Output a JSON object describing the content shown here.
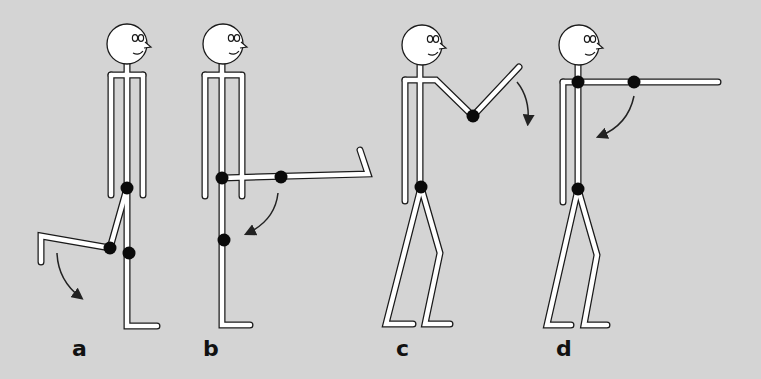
{
  "diagram": {
    "background": "#d4d4d4",
    "limb_fill": "#ffffff",
    "limb_outline": "#1a1a1a",
    "joint_color": "#0a0a0a",
    "figures": [
      {
        "id": "a",
        "label": "a",
        "label_pos": [
          72,
          336
        ],
        "description": "Standing figure flexing hip and knee; lower leg swinging down",
        "head": [
          127,
          44
        ],
        "limbs": [
          [
            [
              127,
              64
            ],
            [
              127,
              326
            ],
            [
              157,
              326
            ]
          ],
          [
            [
              111,
              75
            ],
            [
              143,
              75
            ]
          ],
          [
            [
              111,
              75
            ],
            [
              111,
              195
            ]
          ],
          [
            [
              143,
              75
            ],
            [
              143,
              195
            ]
          ],
          [
            [
              127,
              188
            ],
            [
              110,
              248
            ],
            [
              41,
              236
            ],
            [
              41,
              262
            ]
          ]
        ],
        "joints": [
          [
            127,
            188
          ],
          [
            110,
            248
          ],
          [
            129,
            253
          ]
        ],
        "arrow": {
          "from": [
            57,
            253
          ],
          "ctrl": [
            58,
            280
          ],
          "to": [
            80,
            297
          ]
        }
      },
      {
        "id": "b",
        "label": "b",
        "label_pos": [
          203,
          336
        ],
        "description": "Standing figure with hip flexed 90°, knee extended, foot up",
        "head": [
          223,
          44
        ],
        "limbs": [
          [
            [
              222,
              64
            ],
            [
              222,
              325
            ],
            [
              250,
              325
            ]
          ],
          [
            [
              205,
              75
            ],
            [
              240,
              75
            ]
          ],
          [
            [
              205,
              75
            ],
            [
              205,
              196
            ]
          ],
          [
            [
              242,
              75
            ],
            [
              242,
              196
            ]
          ],
          [
            [
              222,
              178
            ],
            [
              368,
              174
            ],
            [
              360,
              150
            ]
          ]
        ],
        "joints": [
          [
            222,
            178
          ],
          [
            281,
            177
          ],
          [
            224,
            240
          ]
        ],
        "arrow": {
          "from": [
            278,
            193
          ],
          "ctrl": [
            275,
            220
          ],
          "to": [
            248,
            233
          ]
        }
      },
      {
        "id": "c",
        "label": "c",
        "label_pos": [
          396,
          336
        ],
        "description": "Standing figure with elbow flexed, forearm raised; forearm swings down",
        "head": [
          422,
          45
        ],
        "limbs": [
          [
            [
              420,
              65
            ],
            [
              420,
              187
            ]
          ],
          [
            [
              405,
              80
            ],
            [
              436,
              80
            ],
            [
              473,
              116
            ],
            [
              519,
              67
            ]
          ],
          [
            [
              405,
              80
            ],
            [
              405,
              201
            ]
          ],
          [
            [
              421,
              187
            ],
            [
              386,
              324
            ],
            [
              413,
              324
            ]
          ],
          [
            [
              421,
              187
            ],
            [
              440,
              253
            ],
            [
              425,
              324
            ],
            [
              450,
              324
            ]
          ]
        ],
        "joints": [
          [
            473,
            116
          ],
          [
            421,
            187
          ]
        ],
        "arrow": {
          "from": [
            517,
            82
          ],
          "ctrl": [
            530,
            98
          ],
          "to": [
            528,
            122
          ]
        }
      },
      {
        "id": "d",
        "label": "d",
        "label_pos": [
          556,
          336
        ],
        "description": "Standing figure with arm extended forward; arm swings down",
        "head": [
          579,
          45
        ],
        "limbs": [
          [
            [
              578,
              65
            ],
            [
              578,
              189
            ]
          ],
          [
            [
              563,
              82
            ],
            [
              718,
              82
            ]
          ],
          [
            [
              563,
              82
            ],
            [
              563,
              202
            ]
          ],
          [
            [
              578,
              189
            ],
            [
              547,
              325
            ],
            [
              571,
              325
            ]
          ],
          [
            [
              578,
              189
            ],
            [
              597,
              255
            ],
            [
              584,
              325
            ],
            [
              607,
              325
            ]
          ]
        ],
        "joints": [
          [
            578,
            82
          ],
          [
            634,
            82
          ],
          [
            578,
            189
          ]
        ],
        "arrow": {
          "from": [
            634,
            96
          ],
          "ctrl": [
            628,
            125
          ],
          "to": [
            600,
            136
          ]
        }
      }
    ]
  }
}
